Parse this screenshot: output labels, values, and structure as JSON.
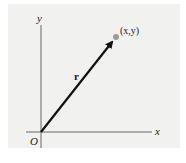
{
  "diagram": {
    "axes": {
      "x_label": "x",
      "y_label": "y",
      "origin_label": "O"
    },
    "vector": {
      "label": "r",
      "point_label": "(x,y)"
    },
    "colors": {
      "panel": "#f1f1f0",
      "axis": "#555555",
      "arrow": "#111111",
      "point": "#9a9a9a"
    }
  }
}
